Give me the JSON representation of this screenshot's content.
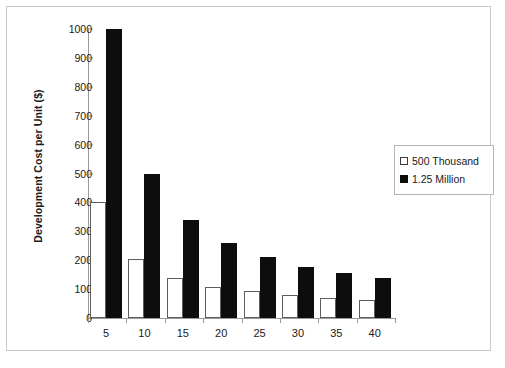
{
  "chart_data": {
    "type": "bar",
    "title": "",
    "xlabel": "",
    "ylabel": "Development Cost per Unit ($)",
    "categories": [
      "5",
      "10",
      "15",
      "20",
      "25",
      "30",
      "35",
      "40"
    ],
    "series": [
      {
        "name": "500 Thousand",
        "swatch": "open-square",
        "color": "#ffffff",
        "values": [
          400,
          205,
          140,
          107,
          92,
          80,
          70,
          63
        ]
      },
      {
        "name": "1.25 Million",
        "swatch": "filled-square",
        "color": "#0d0d0d",
        "values": [
          1000,
          500,
          340,
          258,
          210,
          177,
          157,
          140
        ]
      }
    ],
    "ylim": [
      0,
      1000
    ],
    "y_ticks": [
      0,
      100,
      200,
      300,
      400,
      500,
      600,
      700,
      800,
      900,
      1000
    ],
    "y_tick_labels": [
      "0",
      "100",
      "200",
      "300",
      "400",
      "500",
      "600",
      "700",
      "800",
      "900",
      "1000"
    ],
    "grid": false,
    "legend_position": "right"
  },
  "legend": {
    "entries": [
      {
        "label": "500 Thousand"
      },
      {
        "label": "1.25 Million"
      }
    ]
  }
}
